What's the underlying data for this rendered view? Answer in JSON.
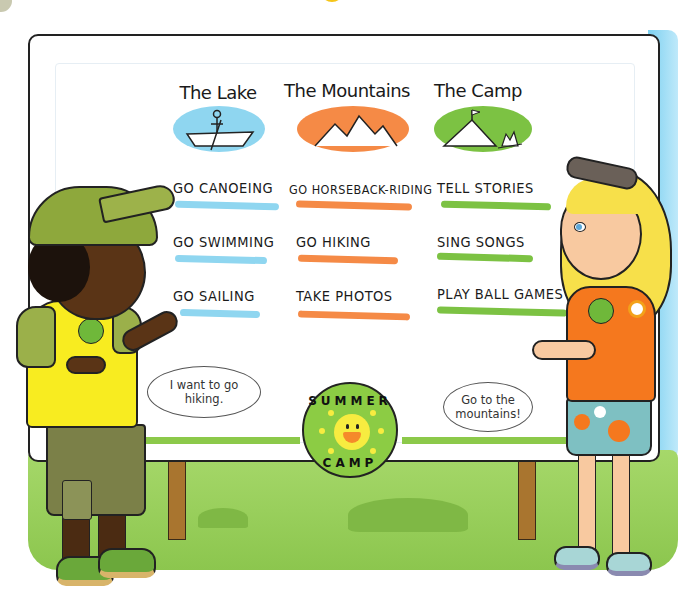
{
  "board": {
    "columns": [
      {
        "header": "The Lake",
        "icon": "canoe-icon",
        "color": "#8fd6f0",
        "activities": [
          "GO CANOEING",
          "GO SWIMMING",
          "GO SAILING"
        ]
      },
      {
        "header": "The Mountains",
        "icon": "mountains-icon",
        "color": "#f58a46",
        "activities": [
          "GO HORSEBACK-RIDING",
          "GO HIKING",
          "TAKE PHOTOS"
        ]
      },
      {
        "header": "The Camp",
        "icon": "tent-campfire-icon",
        "color": "#7cc243",
        "activities": [
          "TELL STORIES",
          "SING SONGS",
          "PLAY BALL GAMES"
        ]
      }
    ],
    "badge": {
      "top_text": "SUMMER",
      "bottom_text": "CAMP",
      "icon": "smiling-sun-icon"
    }
  },
  "speech": {
    "boy": "I want to go hiking.",
    "girl": "Go to the mountains!"
  },
  "colors": {
    "lake": "#8fd6f0",
    "mountains": "#f58a46",
    "camp": "#7cc243",
    "grass": "#9fd461",
    "badge_green": "#8ccc44"
  }
}
